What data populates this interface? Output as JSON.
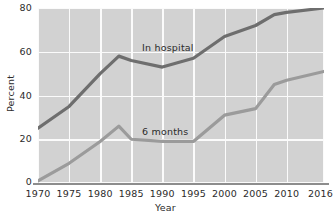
{
  "chart_data": {
    "type": "line",
    "title": "",
    "xlabel": "Year",
    "ylabel": "Percent",
    "xlim": [
      1970,
      2016
    ],
    "ylim": [
      0,
      80
    ],
    "grid": true,
    "legend_position": "inline-annotation",
    "xticks": [
      "1970",
      "1975",
      "1980",
      "1985",
      "1990",
      "1995",
      "2000",
      "2005",
      "2010",
      "2016"
    ],
    "yticks": [
      "0",
      "20",
      "40",
      "60",
      "80"
    ],
    "x": [
      1970,
      1975,
      1980,
      1983,
      1985,
      1990,
      1995,
      2000,
      2005,
      2008,
      2010,
      2016
    ],
    "series": [
      {
        "name": "In hospital",
        "color": "#6e6e6e",
        "values": [
          25,
          35,
          50,
          58,
          56,
          53,
          57,
          67,
          72,
          77,
          78,
          80
        ]
      },
      {
        "name": "6 months",
        "color": "#9b9b9b",
        "values": [
          1,
          9,
          19,
          26,
          20,
          19,
          19,
          31,
          34,
          45,
          47,
          51
        ]
      }
    ],
    "annotations": [
      {
        "text": "In hospital",
        "series": "In hospital"
      },
      {
        "text": "6 months",
        "series": "6 months"
      }
    ],
    "colors": {
      "plot_background": "#d2d2d2",
      "gridline": "#fbfbfb",
      "axis": "#8d8d8d",
      "text": "#2b2b2b",
      "in_hospital_line": "#6e6e6e",
      "six_months_line": "#9b9b9b"
    }
  }
}
